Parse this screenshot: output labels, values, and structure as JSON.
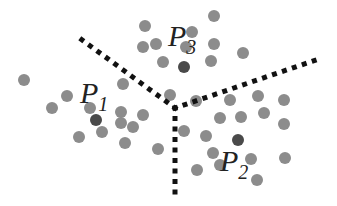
{
  "diagram": {
    "type": "voronoi-partition",
    "colors": {
      "point": "#8c8c8c",
      "center": "#4a4a4a",
      "boundary": "#111111",
      "label": "#222222",
      "background": "#ffffff"
    },
    "centers": [
      {
        "id": "P1",
        "label": "P",
        "subscript": "1",
        "x": 96,
        "y": 120,
        "label_x": 80,
        "label_y": 103
      },
      {
        "id": "P2",
        "label": "P",
        "subscript": "2",
        "x": 238,
        "y": 140,
        "label_x": 220,
        "label_y": 171
      },
      {
        "id": "P3",
        "label": "P",
        "subscript": "3",
        "x": 184,
        "y": 67,
        "label_x": 168,
        "label_y": 46
      }
    ],
    "junction": {
      "x": 175,
      "y": 108
    },
    "boundaries": [
      {
        "id": "boundary-p1-p3",
        "x1": 175,
        "y1": 108,
        "x2": 74,
        "y2": 34
      },
      {
        "id": "boundary-p3-p2",
        "x1": 175,
        "y1": 108,
        "x2": 316,
        "y2": 60
      },
      {
        "id": "boundary-p1-p2",
        "x1": 175,
        "y1": 108,
        "x2": 175,
        "y2": 192
      }
    ],
    "points": [
      {
        "x": 145,
        "y": 26
      },
      {
        "x": 214,
        "y": 16
      },
      {
        "x": 143,
        "y": 47
      },
      {
        "x": 156,
        "y": 44
      },
      {
        "x": 192,
        "y": 32
      },
      {
        "x": 186,
        "y": 47
      },
      {
        "x": 214,
        "y": 44
      },
      {
        "x": 243,
        "y": 53
      },
      {
        "x": 163,
        "y": 62
      },
      {
        "x": 211,
        "y": 61
      },
      {
        "x": 24,
        "y": 80
      },
      {
        "x": 67,
        "y": 96
      },
      {
        "x": 123,
        "y": 84
      },
      {
        "x": 170,
        "y": 95
      },
      {
        "x": 52,
        "y": 108
      },
      {
        "x": 90,
        "y": 108
      },
      {
        "x": 121,
        "y": 112
      },
      {
        "x": 143,
        "y": 115
      },
      {
        "x": 79,
        "y": 137
      },
      {
        "x": 102,
        "y": 132
      },
      {
        "x": 121,
        "y": 123
      },
      {
        "x": 133,
        "y": 127
      },
      {
        "x": 125,
        "y": 143
      },
      {
        "x": 158,
        "y": 149
      },
      {
        "x": 196,
        "y": 101
      },
      {
        "x": 230,
        "y": 100
      },
      {
        "x": 258,
        "y": 96
      },
      {
        "x": 284,
        "y": 100
      },
      {
        "x": 220,
        "y": 118
      },
      {
        "x": 241,
        "y": 117
      },
      {
        "x": 264,
        "y": 113
      },
      {
        "x": 284,
        "y": 124
      },
      {
        "x": 184,
        "y": 131
      },
      {
        "x": 206,
        "y": 136
      },
      {
        "x": 213,
        "y": 153
      },
      {
        "x": 251,
        "y": 159
      },
      {
        "x": 285,
        "y": 158
      },
      {
        "x": 197,
        "y": 170
      },
      {
        "x": 220,
        "y": 165
      },
      {
        "x": 257,
        "y": 180
      }
    ]
  }
}
